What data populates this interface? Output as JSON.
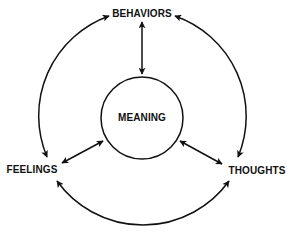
{
  "diagram": {
    "nodes": {
      "center": {
        "label": "MEANING"
      },
      "top": {
        "label": "BEHAVIORS"
      },
      "left": {
        "label": "FEELINGS"
      },
      "right": {
        "label": "THOUGHTS"
      }
    },
    "edges": [
      {
        "from": "MEANING",
        "to": "BEHAVIORS",
        "type": "bidirectional-straight"
      },
      {
        "from": "MEANING",
        "to": "FEELINGS",
        "type": "bidirectional-straight"
      },
      {
        "from": "MEANING",
        "to": "THOUGHTS",
        "type": "bidirectional-straight"
      },
      {
        "from": "BEHAVIORS",
        "to": "FEELINGS",
        "type": "bidirectional-arc"
      },
      {
        "from": "BEHAVIORS",
        "to": "THOUGHTS",
        "type": "bidirectional-arc"
      },
      {
        "from": "FEELINGS",
        "to": "THOUGHTS",
        "type": "bidirectional-arc"
      }
    ],
    "colors": {
      "stroke": "#111111",
      "background": "#ffffff"
    }
  }
}
